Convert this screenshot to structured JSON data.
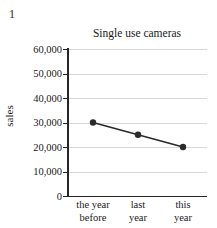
{
  "question_number": "1",
  "chart_data": {
    "type": "line",
    "title": "Single use cameras",
    "xlabel": "",
    "ylabel": "sales",
    "categories": [
      "the year before",
      "last year",
      "this year"
    ],
    "category_lines": [
      [
        "the year",
        "before"
      ],
      [
        "last",
        "year"
      ],
      [
        "this",
        "year"
      ]
    ],
    "values": [
      30000,
      25000,
      20000
    ],
    "series": [
      {
        "name": "sales",
        "values": [
          30000,
          25000,
          20000
        ]
      }
    ],
    "ylim": [
      0,
      60000
    ],
    "ytick_values": [
      0,
      10000,
      20000,
      30000,
      40000,
      50000,
      60000
    ],
    "ytick_labels": [
      "0",
      "10,000",
      "20,000",
      "30,000",
      "40,000",
      "50,000",
      "60,000"
    ],
    "grid": true,
    "grid_axis": "y",
    "legend": "none",
    "marker": "filled-circle",
    "line_color": "#2b2b2b",
    "marker_color": "#2b2b2b",
    "grid_color": "#d8d8d8",
    "axis_color": "#262626",
    "background_color": "#ffffff"
  }
}
